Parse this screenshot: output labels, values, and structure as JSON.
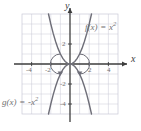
{
  "figure": {
    "name": "parabola-reflection-figure",
    "background": "#ffffff",
    "grid_color": "#c9c9d6",
    "axis_color": "#3d3d3d",
    "curve_color": "#6e6e78",
    "label_color": "#6f6f6f"
  },
  "axes": {
    "x_letter": "x",
    "y_letter": "y",
    "x_ticks": [
      {
        "value": -4,
        "label": "-4"
      },
      {
        "value": -2,
        "label": "-2"
      },
      {
        "value": 2,
        "label": "2"
      },
      {
        "value": 4,
        "label": "4"
      }
    ],
    "y_ticks": [
      {
        "value": 2,
        "label": "2"
      },
      {
        "value": -2,
        "label": "-2"
      },
      {
        "value": -4,
        "label": "-4"
      }
    ]
  },
  "annotations": {
    "f_label": {
      "fn": "f",
      "var": "x",
      "op": "=",
      "base": "x",
      "exp": "2"
    },
    "g_label": {
      "fn": "g",
      "var": "x",
      "op": "=",
      "base": "-x",
      "exp": "2"
    }
  },
  "chart_data": {
    "type": "line",
    "title": "",
    "xlabel": "x",
    "ylabel": "y",
    "xlim": [
      -5,
      5
    ],
    "ylim": [
      -5,
      5
    ],
    "grid": true,
    "legend": "inline-annotations",
    "xticks": [
      -4,
      -2,
      2,
      4
    ],
    "yticks": [
      2,
      -2,
      -4
    ],
    "series": [
      {
        "name": "f(x) = x^2",
        "expression": "x^2",
        "color": "#6e6e78",
        "x": [
          -2.24,
          -2.0,
          -1.75,
          -1.5,
          -1.25,
          -1.0,
          -0.75,
          -0.5,
          -0.25,
          0,
          0.25,
          0.5,
          0.75,
          1.0,
          1.25,
          1.5,
          1.75,
          2.0,
          2.24
        ],
        "y": [
          5.0,
          4.0,
          3.06,
          2.25,
          1.56,
          1.0,
          0.56,
          0.25,
          0.06,
          0,
          0.06,
          0.25,
          0.56,
          1.0,
          1.56,
          2.25,
          3.06,
          4.0,
          5.0
        ]
      },
      {
        "name": "g(x) = -x^2",
        "expression": "-x^2",
        "color": "#6e6e78",
        "x": [
          -2.24,
          -2.0,
          -1.75,
          -1.5,
          -1.25,
          -1.0,
          -0.75,
          -0.5,
          -0.25,
          0,
          0.25,
          0.5,
          0.75,
          1.0,
          1.25,
          1.5,
          1.75,
          2.0,
          2.24
        ],
        "y": [
          -5.0,
          -4.0,
          -3.06,
          -2.25,
          -1.56,
          -1.0,
          -0.56,
          -0.25,
          -0.06,
          0,
          -0.06,
          -0.25,
          -0.56,
          -1.0,
          -1.56,
          -2.25,
          -3.06,
          -4.0,
          -5.0
        ]
      }
    ],
    "annotations": [
      {
        "text": "f(x) = x^2",
        "x": 2.6,
        "y": 3.4
      },
      {
        "text": "g(x) = -x^2",
        "x": -4.9,
        "y": -3.6
      }
    ],
    "reflection_arcs": [
      {
        "from": [
          -1.0,
          1.0
        ],
        "to": [
          -1.0,
          -1.0
        ],
        "direction": "clockwise"
      },
      {
        "from": [
          1.0,
          1.0
        ],
        "to": [
          1.0,
          -1.0
        ],
        "direction": "counterclockwise"
      }
    ]
  }
}
